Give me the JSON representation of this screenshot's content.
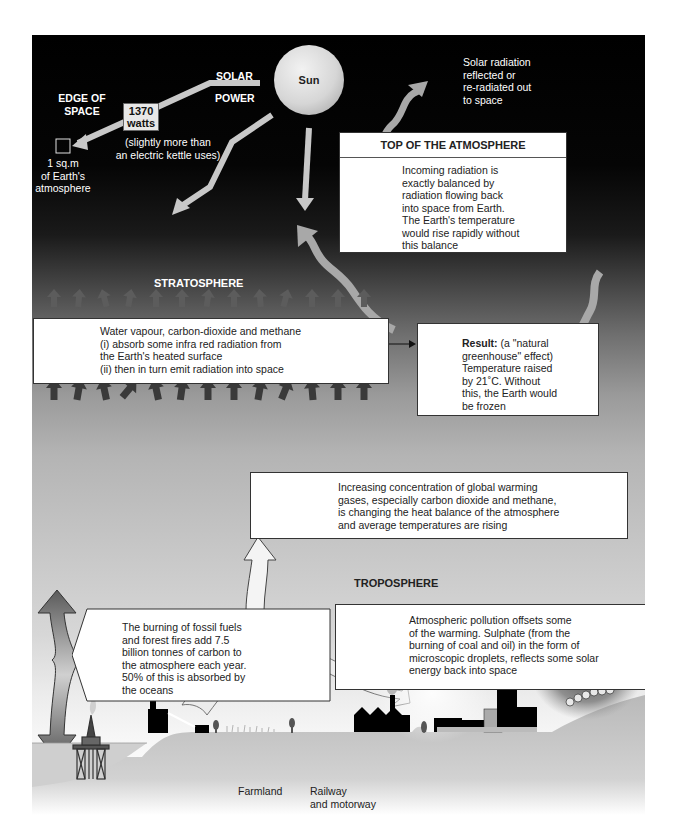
{
  "diagram": {
    "space": {
      "edge_of_space": [
        "EDGE OF",
        "SPACE"
      ],
      "solar_power": [
        "SOLAR",
        "POWER"
      ],
      "sun_label": "Sun",
      "power_value": [
        "1370",
        "watts"
      ],
      "power_note": [
        "(slightly more than",
        "an electric kettle uses)"
      ],
      "unit_area_label": [
        "1 sq.m",
        "of Earth's",
        "atmosphere"
      ],
      "reflected_note": [
        "Solar radiation",
        "reflected or",
        "re-radiated out",
        "to space"
      ]
    },
    "top_box": {
      "heading": "TOP OF THE ATMOSPHERE",
      "lines": [
        "Incoming radiation is",
        "exactly balanced by",
        "radiation flowing back",
        "into space from Earth.",
        "The Earth's temperature",
        "would rise rapidly without",
        "this balance"
      ]
    },
    "layers": {
      "stratosphere": "STRATOSPHERE",
      "troposphere": "TROPOSPHERE"
    },
    "gases_box": {
      "lines": [
        "Water vapour, carbon-dioxide and methane",
        "(i) absorb some infra red radiation from",
        "the Earth's heated surface",
        "(ii) then in turn emit radiation into space"
      ]
    },
    "result_box": {
      "bold_label": "Result:",
      "first_line_rest": " (a \"natural",
      "lines": [
        "greenhouse\" effect)",
        "Temperature raised",
        "by 21˚C. Without",
        "this, the Earth would",
        "be frozen"
      ]
    },
    "warming_box": {
      "lines": [
        "Increasing concentration of global warming",
        "gases, especially carbon dioxide and methane,",
        "is changing the heat balance of the atmosphere",
        "and average temperatures are rising"
      ]
    },
    "fossil_box": {
      "lines": [
        "The burning of fossil fuels",
        "and forest fires add 7.5",
        "billion tonnes of carbon to",
        "the atmosphere each year.",
        "50% of this is absorbed by",
        "the oceans"
      ]
    },
    "pollution_box": {
      "lines": [
        "Atmospheric pollution offsets some",
        "of the warming. Sulphate (from the",
        "burning of coal and oil) in the form of",
        "microscopic droplets, reflects some solar",
        "energy back into space"
      ]
    },
    "ground_labels": {
      "farmland": "Farmland",
      "railway": [
        "Railway",
        "and motorway"
      ]
    },
    "colors": {
      "space_black": "#000000",
      "arrow_light": "#c8c8c8",
      "arrow_dark": "#4a4a4a",
      "box_bg": "#ffffff",
      "ground": "#bdbdbd"
    }
  }
}
